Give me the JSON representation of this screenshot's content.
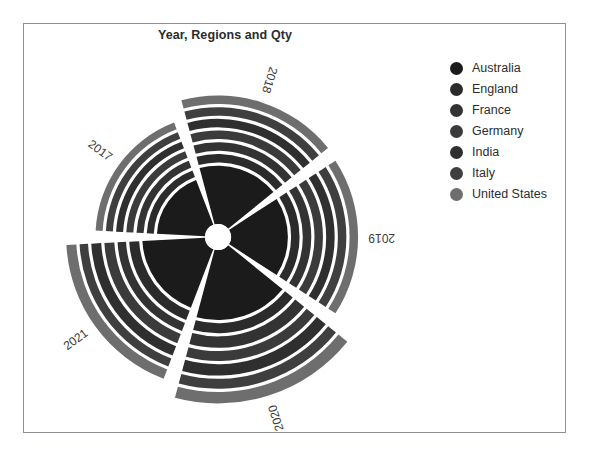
{
  "chart_data": {
    "type": "pie",
    "subtype": "polar-stacked-radial",
    "title": "Year, Regions and Qty",
    "xlabel": "",
    "ylabel": "",
    "categories": [
      "2017",
      "2018",
      "2019",
      "2020",
      "2021"
    ],
    "category_axis": "Year",
    "legend_title": "Regions",
    "legend_position": "right",
    "grid": false,
    "value_label": "Qty",
    "series": [
      {
        "name": "Australia",
        "color": "#1b1b1b",
        "values": [
          34,
          41,
          40,
          49,
          44
        ]
      },
      {
        "name": "England",
        "color": "#2b2b2b",
        "values": [
          41,
          49,
          48,
          58,
          53
        ]
      },
      {
        "name": "France",
        "color": "#333333",
        "values": [
          48,
          57,
          56,
          68,
          61
        ]
      },
      {
        "name": "Germany",
        "color": "#3b3b3b",
        "values": [
          55,
          65,
          64,
          77,
          70
        ]
      },
      {
        "name": "India",
        "color": "#2f2f2f",
        "values": [
          62,
          73,
          72,
          87,
          79
        ]
      },
      {
        "name": "Italy",
        "color": "#3f3f3f",
        "values": [
          69,
          81,
          80,
          96,
          87
        ]
      },
      {
        "name": "United States",
        "color": "#6e6e6e",
        "values": [
          76,
          89,
          88,
          106,
          96
        ]
      }
    ],
    "radial_totals": {
      "2017": 76,
      "2018": 89,
      "2019": 88,
      "2020": 106,
      "2021": 96
    },
    "rlim": [
      0,
      110
    ]
  },
  "legend": {
    "items": [
      {
        "label": "Australia",
        "color": "#1b1b1b"
      },
      {
        "label": "England",
        "color": "#2b2b2b"
      },
      {
        "label": "France",
        "color": "#333333"
      },
      {
        "label": "Germany",
        "color": "#3b3b3b"
      },
      {
        "label": "India",
        "color": "#2f2f2f"
      },
      {
        "label": "Italy",
        "color": "#3f3f3f"
      },
      {
        "label": "United States",
        "color": "#6e6e6e"
      }
    ]
  },
  "style": {
    "background": "#ffffff",
    "frame_color": "#8d9094",
    "gap_color": "#ffffff",
    "title_color": "#2b2b2b",
    "label_color": "#3a3a3a"
  }
}
